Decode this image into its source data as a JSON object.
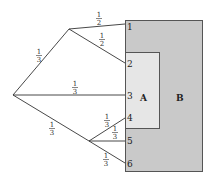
{
  "diagram": {
    "colors": {
      "region_b": "#c9c9c9",
      "region_a": "#e6e6e6",
      "border": "#555555",
      "edge": "#333333"
    },
    "regions": [
      {
        "id": "B",
        "label": "B"
      },
      {
        "id": "A",
        "label": "A"
      }
    ],
    "outcomes": [
      "1",
      "2",
      "3",
      "4",
      "5",
      "6"
    ],
    "edges": [
      {
        "from": "root",
        "to": "upper",
        "prob": {
          "n": "1",
          "d": "3"
        }
      },
      {
        "from": "root",
        "to": "3",
        "prob": {
          "n": "1",
          "d": "3"
        }
      },
      {
        "from": "root",
        "to": "lower",
        "prob": {
          "n": "1",
          "d": "3"
        }
      },
      {
        "from": "upper",
        "to": "1",
        "prob": {
          "n": "1",
          "d": "2"
        }
      },
      {
        "from": "upper",
        "to": "2",
        "prob": {
          "n": "1",
          "d": "2"
        }
      },
      {
        "from": "lower",
        "to": "4",
        "prob": {
          "n": "1",
          "d": "3"
        }
      },
      {
        "from": "lower",
        "to": "5",
        "prob": {
          "n": "1",
          "d": "3"
        }
      },
      {
        "from": "lower",
        "to": "6",
        "prob": {
          "n": "1",
          "d": "3"
        }
      }
    ]
  }
}
